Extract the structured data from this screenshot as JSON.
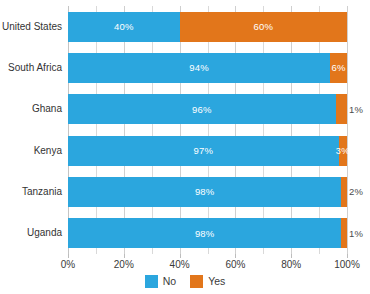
{
  "chart_data": {
    "type": "bar",
    "orientation": "horizontal",
    "stacked": true,
    "title": "",
    "subtitle": "",
    "xlabel": "",
    "ylabel": "",
    "xlim": [
      0,
      100
    ],
    "grid": true,
    "legend_position": "bottom",
    "categories": [
      "United States",
      "South Africa",
      "Ghana",
      "Kenya",
      "Tanzania",
      "Uganda"
    ],
    "series": [
      {
        "name": "No",
        "color": "#2ba6de",
        "values": [
          40,
          94,
          96,
          97,
          98,
          98
        ]
      },
      {
        "name": "Yes",
        "color": "#e2761b",
        "values": [
          60,
          6,
          4,
          3,
          2,
          1
        ]
      }
    ],
    "x_ticks": [
      {
        "value": 0,
        "label": "0%"
      },
      {
        "value": 20,
        "label": "20%"
      },
      {
        "value": 40,
        "label": "40%"
      },
      {
        "value": 60,
        "label": "60%"
      },
      {
        "value": 80,
        "label": "80%"
      },
      {
        "value": 100,
        "label": "100%"
      }
    ],
    "minor_gridline_step": 10,
    "bars": [
      {
        "category": "United States",
        "segments": [
          {
            "series": "No",
            "value": 40,
            "label": "40%",
            "label_inside": true
          },
          {
            "series": "Yes",
            "value": 60,
            "label": "60%",
            "label_inside": true
          }
        ]
      },
      {
        "category": "South Africa",
        "segments": [
          {
            "series": "No",
            "value": 94,
            "label": "94%",
            "label_inside": true
          },
          {
            "series": "Yes",
            "value": 6,
            "label": "6%",
            "label_inside": true
          }
        ]
      },
      {
        "category": "Ghana",
        "segments": [
          {
            "series": "No",
            "value": 96,
            "label": "96%",
            "label_inside": true
          },
          {
            "series": "Yes",
            "value": 4,
            "label": "1%",
            "label_inside": false
          }
        ]
      },
      {
        "category": "Kenya",
        "segments": [
          {
            "series": "No",
            "value": 97,
            "label": "97%",
            "label_inside": true
          },
          {
            "series": "Yes",
            "value": 3,
            "label": "3%",
            "label_inside": true
          }
        ]
      },
      {
        "category": "Tanzania",
        "segments": [
          {
            "series": "No",
            "value": 98,
            "label": "98%",
            "label_inside": true
          },
          {
            "series": "Yes",
            "value": 2,
            "label": "2%",
            "label_inside": false
          }
        ]
      },
      {
        "category": "Uganda",
        "segments": [
          {
            "series": "No",
            "value": 98,
            "label": "98%",
            "label_inside": true
          },
          {
            "series": "Yes",
            "value": 2,
            "label": "1%",
            "label_inside": false
          }
        ]
      }
    ],
    "legend": [
      {
        "label": "No",
        "color": "#2ba6de"
      },
      {
        "label": "Yes",
        "color": "#e2761b"
      }
    ],
    "colors": {
      "no": "#2ba6de",
      "yes": "#e2761b",
      "background": "#ffffff",
      "gridline": "#d9d9d9",
      "text": "#3a3a3a"
    }
  }
}
